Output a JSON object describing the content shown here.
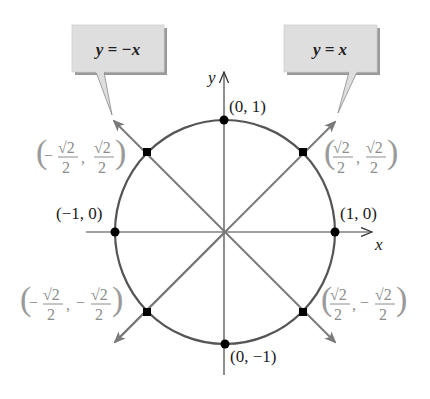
{
  "callouts": {
    "left": {
      "label": "y = −x"
    },
    "right": {
      "label": "y = x"
    }
  },
  "axes": {
    "x_label": "x",
    "y_label": "y"
  },
  "points": {
    "top": {
      "label": "(0, 1)"
    },
    "bottom": {
      "label": "(0, −1)"
    },
    "left": {
      "label": "(−1, 0)"
    },
    "right": {
      "label": "(1, 0)"
    },
    "upper_right": {
      "x": "√2/2",
      "y": "√2/2",
      "num": "√2",
      "den": "2",
      "sign_x": "",
      "sign_y": ""
    },
    "upper_left": {
      "x": "−√2/2",
      "y": "√2/2",
      "num": "√2",
      "den": "2",
      "sign_x": "−",
      "sign_y": ""
    },
    "lower_left": {
      "x": "−√2/2",
      "y": "−√2/2",
      "num": "√2",
      "den": "2",
      "sign_x": "−",
      "sign_y": "−"
    },
    "lower_right": {
      "x": "√2/2",
      "y": "−√2/2",
      "num": "√2",
      "den": "2",
      "sign_x": "",
      "sign_y": "−"
    }
  },
  "colors": {
    "circle": "#555555",
    "diagonal": "#7a7a7a",
    "axis": "#444444",
    "dot": "#000000",
    "callout_fill": "#dedede",
    "callout_shadow": "#9a9a9a",
    "gray_label": "#8c8c8c"
  }
}
